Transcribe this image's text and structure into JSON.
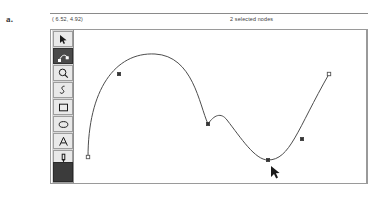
{
  "figure": {
    "label": "a."
  },
  "statusbar": {
    "coordinates": "( 6.52, 4.92)",
    "selection": "2 selected nodes"
  },
  "toolbar": {
    "tools": [
      {
        "name": "select-arrow-tool",
        "icon": "arrow-cursor-icon",
        "active": false
      },
      {
        "name": "node-edit-tool",
        "icon": "node-edit-icon",
        "active": true
      },
      {
        "name": "zoom-tool",
        "icon": "magnifier-icon",
        "active": false
      },
      {
        "name": "pen-tool",
        "icon": "pen-icon",
        "active": false
      },
      {
        "name": "rectangle-tool",
        "icon": "rectangle-icon",
        "active": false
      },
      {
        "name": "ellipse-tool",
        "icon": "ellipse-icon",
        "active": false
      },
      {
        "name": "text-tool",
        "icon": "text-a-icon",
        "active": false
      },
      {
        "name": "dropper-tool",
        "icon": "dropper-icon",
        "active": false
      },
      {
        "name": "calligraphy-tool",
        "icon": "calligraphy-icon",
        "active": false
      }
    ]
  },
  "canvas": {
    "path_color": "#4d4d4d",
    "node_fill_color": "#333333",
    "node_outline_color": "#555555",
    "curve_path": "M 13 127 C 13 60, 40 22, 80 24 C 118 26, 124 74, 133 94 C 139 85, 146 82, 152 90 C 166 108, 180 130, 193 130 C 215 130, 222 100, 254 44",
    "nodes": [
      {
        "name": "node-endpoint-left",
        "x": 13,
        "y": 127,
        "type": "hollow-square",
        "selected": false
      },
      {
        "name": "node-selected-upper",
        "x": 44,
        "y": 44,
        "type": "filled-square",
        "selected": true
      },
      {
        "name": "node-cusp",
        "x": 133,
        "y": 94,
        "type": "filled-square",
        "selected": false
      },
      {
        "name": "node-selected-bottom",
        "x": 193,
        "y": 130,
        "type": "filled-square",
        "selected": true
      },
      {
        "name": "node-right-slope",
        "x": 227,
        "y": 109,
        "type": "filled-square",
        "selected": false
      },
      {
        "name": "node-endpoint-right",
        "x": 254,
        "y": 44,
        "type": "hollow-square",
        "selected": false
      }
    ],
    "cursor": {
      "name": "mouse-pointer",
      "x": 196,
      "y": 136
    }
  }
}
